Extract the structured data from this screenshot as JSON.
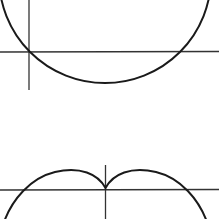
{
  "diagrams": [
    {
      "id": "circle",
      "description": "Circle passing through the origin, drawn with x and y axes",
      "stroke": "#1a1a1a",
      "axis_color": "#333333"
    },
    {
      "id": "cardioid",
      "description": "Cardioid-like curve with a cusp at the origin, drawn with x and y axes",
      "stroke": "#1a1a1a",
      "axis_color": "#333333"
    }
  ]
}
